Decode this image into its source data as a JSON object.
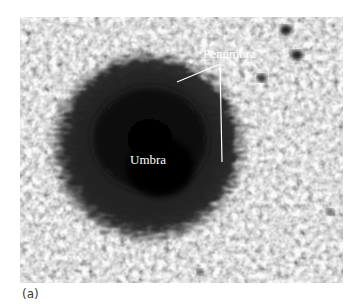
{
  "figure": {
    "panel_label": "(a)",
    "annotations": [
      {
        "id": "penumbra",
        "text": "Penumbra"
      },
      {
        "id": "umbra",
        "text": "Umbra"
      }
    ],
    "colors": {
      "background": "#ffffff",
      "granulation_light": "#bdbdbd",
      "granulation_dark": "#7a7a7a",
      "umbra": "#050505",
      "penumbra": "#2a2a2a",
      "annotation": "#ffffff",
      "caption": "#3a3a3a"
    }
  }
}
